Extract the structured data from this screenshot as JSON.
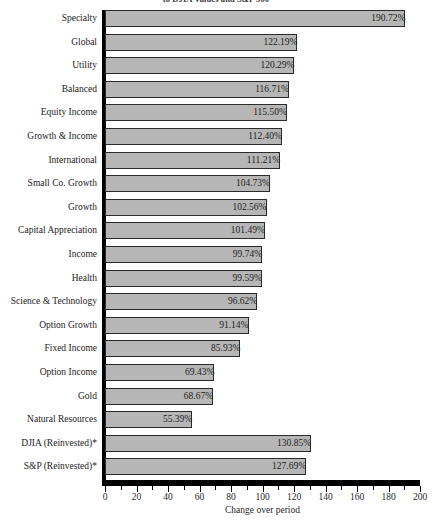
{
  "chart_data": {
    "type": "bar",
    "orientation": "horizontal",
    "title": "to DJIA Values and S&P 500",
    "xlabel": "Change over period",
    "ylabel": "",
    "xlim": [
      0,
      200
    ],
    "xticks": [
      0,
      20,
      40,
      60,
      80,
      100,
      120,
      140,
      160,
      180,
      200
    ],
    "xtick_labels": [
      "0",
      "20",
      "40",
      "60",
      "80",
      "100",
      "120",
      "140",
      "160",
      "180",
      "200"
    ],
    "minor_ticks_per_interval": 1,
    "grid": false,
    "legend": null,
    "value_suffix": "%",
    "bar_fill_color": "#b6b6b6",
    "bar_border_color": "#2b2b2b",
    "axis_color": "#000000",
    "categories": [
      "Specialty",
      "Global",
      "Utility",
      "Balanced",
      "Equity Income",
      "Growth & Income",
      "International",
      "Small Co. Growth",
      "Growth",
      "Capital Appreciation",
      "Income",
      "Health",
      "Science & Technology",
      "Option Growth",
      "Fixed Income",
      "Option Income",
      "Gold",
      "Natural Resources",
      "DJIA (Reinvested)*",
      "S&P (Reinvested)*"
    ],
    "values": [
      190.72,
      122.19,
      120.29,
      116.71,
      115.5,
      112.4,
      111.21,
      104.73,
      102.56,
      101.49,
      99.74,
      99.59,
      96.62,
      91.14,
      85.93,
      69.43,
      68.67,
      55.39,
      130.85,
      127.69
    ],
    "value_labels": [
      "190.72%",
      "122.19%",
      "120.29%",
      "116.71%",
      "115.50%",
      "112.40%",
      "111.21%",
      "104.73%",
      "102.56%",
      "101.49%",
      "99.74%",
      "99.59%",
      "96.62%",
      "91.14%",
      "85.93%",
      "69.43%",
      "68.67%",
      "55.39%",
      "130.85%",
      "127.69%"
    ]
  },
  "caption": ""
}
